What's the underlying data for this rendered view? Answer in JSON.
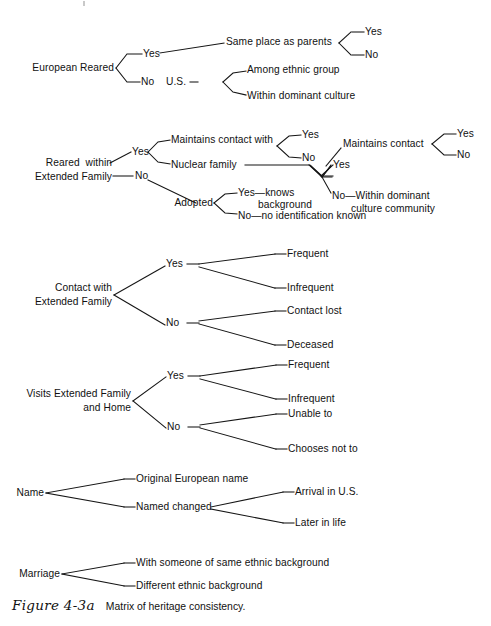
{
  "figure": {
    "number": "Figure 4-3a",
    "caption": "Matrix of heritage consistency."
  },
  "trees": [
    {
      "id": "european-reared",
      "root": "European Reared",
      "nodes": {
        "yes": "Yes",
        "no": "No",
        "us": "U.S.",
        "same_place": "Same place as parents",
        "same_place_yes": "Yes",
        "same_place_no": "No",
        "among_ethnic": "Among ethnic group",
        "within_dominant": "Within dominant culture"
      }
    },
    {
      "id": "reared-within-extended-family",
      "root_line1": "Reared  within",
      "root_line2": "Extended Family",
      "nodes": {
        "yes": "Yes",
        "no": "No",
        "maintains_contact_with": "Maintains contact with",
        "mcw_yes": "Yes",
        "mcw_no": "No",
        "nuclear_family": "Nuclear family",
        "nf_yes": "Yes",
        "nf_no_line1": "No—Within dominant",
        "nf_no_line2": "culture community",
        "maintains_contact": "Maintains contact",
        "mc_yes": "Yes",
        "mc_no": "No",
        "adopted": "Adopted",
        "adopted_yes_line1": "Yes—knows",
        "adopted_yes_line2": "background",
        "adopted_no": "No—no identification known"
      }
    },
    {
      "id": "contact-with-extended-family",
      "root_line1": "Contact with",
      "root_line2": "Extended Family",
      "nodes": {
        "yes": "Yes",
        "no": "No",
        "frequent": "Frequent",
        "infrequent": "Infrequent",
        "contact_lost": "Contact lost",
        "deceased": "Deceased"
      }
    },
    {
      "id": "visits-extended-family-and-home",
      "root_line1": "Visits Extended Family",
      "root_line2": "and Home",
      "nodes": {
        "yes": "Yes",
        "no": "No",
        "frequent": "Frequent",
        "infrequent": "Infrequent",
        "unable_to": "Unable to",
        "chooses_not_to": "Chooses not to"
      }
    },
    {
      "id": "name",
      "root": "Name",
      "nodes": {
        "original_name": "Original European name",
        "named_changed": "Named changed",
        "arrival_in_us": "Arrival in U.S.",
        "later_in_life": "Later in life"
      }
    },
    {
      "id": "marriage",
      "root": "Marriage",
      "nodes": {
        "same_ethnic": "With someone of same ethnic background",
        "different_ethnic": "Different ethnic background"
      }
    }
  ]
}
